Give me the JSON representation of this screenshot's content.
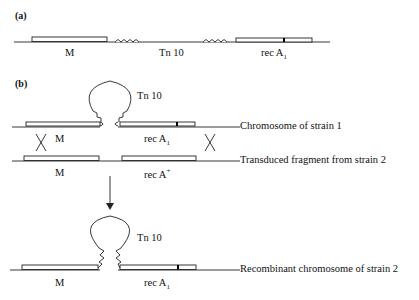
{
  "panel_a": {
    "label": "(a)",
    "gene_m": "M",
    "transposon": "Tn 10",
    "gene_reca_base": "rec A",
    "gene_reca_sub": "1"
  },
  "panel_b": {
    "label": "(b)",
    "top": {
      "transposon": "Tn 10",
      "gene_m": "M",
      "gene_reca_base": "rec A",
      "gene_reca_sub": "1",
      "caption": "Chromosome of strain 1"
    },
    "fragment": {
      "gene_m": "M",
      "gene_reca_base": "rec A",
      "gene_reca_sup": "+",
      "caption": "Transduced fragment from strain 2"
    },
    "result": {
      "transposon": "Tn 10",
      "gene_m": "M",
      "gene_reca_base": "rec A",
      "gene_reca_sub": "1",
      "caption": "Recombinant chromosome of strain 2"
    }
  },
  "colors": {
    "line": "#222222",
    "mutation_mark": "#000000"
  }
}
